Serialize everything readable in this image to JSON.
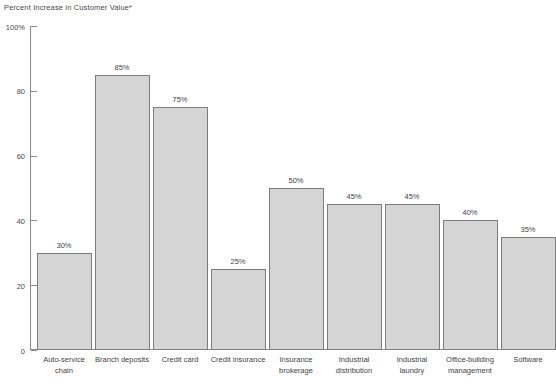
{
  "chart_data": {
    "type": "bar",
    "title": "Percent Increase in Customer Value*",
    "xlabel": "",
    "ylabel": "",
    "ylim": [
      0,
      100
    ],
    "yticks": [
      "0",
      "20",
      "40",
      "60",
      "80",
      "100%"
    ],
    "ytick_values": [
      0,
      20,
      40,
      60,
      80,
      100
    ],
    "grid": false,
    "legend": "none",
    "categories": [
      "Auto-service chain",
      "Branch deposits",
      "Credit card",
      "Credit insurance",
      "Insurance brokerage",
      "Industrial distribution",
      "Industrial laundry",
      "Office-building management",
      "Software"
    ],
    "values": [
      30,
      85,
      75,
      25,
      50,
      45,
      45,
      40,
      35
    ],
    "value_labels": [
      "30%",
      "85%",
      "75%",
      "25%",
      "50%",
      "45%",
      "45%",
      "40%",
      "35%"
    ],
    "bar_color": "#d5d5d5",
    "bar_border_color": "#7d7d7d",
    "axis_color": "#8c8c8c",
    "text_color": "#3f3f3f"
  },
  "categories_wrapped": [
    [
      "Auto-service",
      "chain"
    ],
    [
      "Branch deposits",
      ""
    ],
    [
      "Credit card",
      ""
    ],
    [
      "Credit insurance",
      ""
    ],
    [
      "Insurance",
      "brokerage"
    ],
    [
      "Industrial",
      "distribution"
    ],
    [
      "Industrial",
      "laundry"
    ],
    [
      "Office-building",
      "management"
    ],
    [
      "Software",
      ""
    ]
  ]
}
